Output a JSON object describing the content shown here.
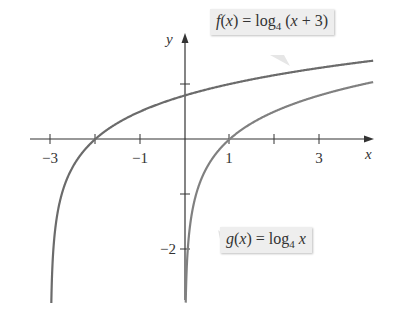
{
  "chart_data": {
    "type": "line",
    "title": "",
    "xlabel": "x",
    "ylabel": "y",
    "xlim": [
      -3.5,
      4.2
    ],
    "ylim": [
      -3,
      1.9
    ],
    "x_ticks": [
      -3,
      -2,
      -1,
      1,
      2,
      3
    ],
    "x_tick_labels": [
      "−3",
      "−1",
      "1",
      "3"
    ],
    "y_ticks": [
      -2,
      -1,
      1
    ],
    "y_tick_labels": [
      "−2"
    ],
    "grid": false,
    "series": [
      {
        "name": "f(x) = log4 (x + 3)",
        "function": "log4(x+3)",
        "domain": [
          -2.99,
          4.2
        ],
        "color": "#6b6b6b",
        "key_points": [
          [
            -2,
            0
          ],
          [
            -2.75,
            -1
          ],
          [
            1,
            1
          ],
          [
            0,
            0.79
          ]
        ]
      },
      {
        "name": "g(x) = log4 x",
        "function": "log4(x)",
        "domain": [
          0.01,
          4.2
        ],
        "color": "#7a7a7a",
        "key_points": [
          [
            1,
            0
          ],
          [
            0.25,
            -1
          ],
          [
            4,
            1
          ]
        ]
      }
    ],
    "annotations": [
      {
        "text_parts": {
          "fn": "f",
          "eq": "(x) = log",
          "base": "4",
          "arg": " (x + 3)"
        },
        "target": "f curve near x≈3"
      },
      {
        "text_parts": {
          "fn": "g",
          "eq": "(x) = log",
          "base": "4",
          "arg": " x"
        },
        "target": "g curve near x≈0.5"
      }
    ]
  },
  "labels": {
    "x_axis": "x",
    "y_axis": "y",
    "tick_m3": "−3",
    "tick_m1": "−1",
    "tick_1": "1",
    "tick_3": "3",
    "tick_m2": "−2"
  },
  "callouts": {
    "f": {
      "fn": "f",
      "open": "(",
      "var": "x",
      "close": ") = log",
      "base": "4",
      "arg_open": " (",
      "arg_var": "x",
      "arg_rest": " + 3)"
    },
    "g": {
      "fn": "g",
      "open": "(",
      "var": "x",
      "close": ") = log",
      "base": "4",
      "arg_var": " x"
    }
  }
}
